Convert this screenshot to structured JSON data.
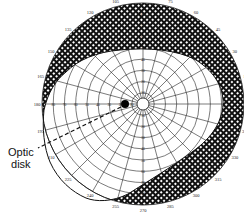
{
  "diagram": {
    "type": "visual-field-perimetry-chart",
    "center": {
      "x": 143,
      "y": 104
    },
    "outer_radius_px": 101,
    "ring_step_deg": 10,
    "max_eccentricity_deg": 90,
    "meridian_step_deg": 15,
    "colors": {
      "lines": "#222222",
      "hatch": "#111111",
      "background": "#ffffff"
    },
    "meridian_labels": [
      "0",
      "15",
      "30",
      "45",
      "60",
      "75",
      "90",
      "105",
      "120",
      "135",
      "150",
      "165",
      "180",
      "195",
      "210",
      "225",
      "240",
      "255",
      "270",
      "285",
      "300",
      "315",
      "330",
      "345"
    ],
    "radial_scale_labels": [
      "10",
      "20",
      "30",
      "40",
      "50",
      "60",
      "70",
      "80"
    ],
    "blind_spot_label": "Optic disk",
    "blind_spot_label_lines": [
      "Optic",
      "disk"
    ],
    "optic_disk": {
      "meridian_deg": 180,
      "eccentricity_deg": 15
    },
    "field_loss": "Crosshatched band of peripheral visual field loss, wide on superior/right and inferior-right side, thin on left"
  }
}
